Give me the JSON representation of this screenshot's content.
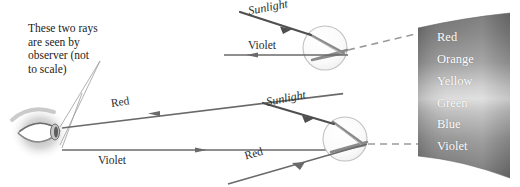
{
  "figure": {
    "background_color": "#ffffff",
    "ink_color": "#555555",
    "annotation": "These two rays\nare seen by\nobserver (not\nto scale)"
  },
  "labels": {
    "sunlight_top": "Sunlight",
    "violet_top": "Violet",
    "sunlight_bottom": "Sunlight",
    "red_bottom": "Red",
    "red_main": "Red",
    "violet_main": "Violet"
  },
  "spectrum": {
    "caption": "Visible spectrum band",
    "bands": [
      {
        "name": "Red",
        "y": 38
      },
      {
        "name": "Orange",
        "y": 60
      },
      {
        "name": "Yellow",
        "y": 82
      },
      {
        "name": "Green",
        "y": 104
      },
      {
        "name": "Blue",
        "y": 125
      },
      {
        "name": "Violet",
        "y": 147
      }
    ]
  },
  "observer": {
    "name": "eye"
  },
  "raindrops": [
    {
      "name": "upper-raindrop",
      "cx": 325,
      "cy": 48,
      "r": 22,
      "exit_ray": "Violet"
    },
    {
      "name": "lower-raindrop",
      "cx": 345,
      "cy": 139,
      "r": 22,
      "exit_ray": "Red"
    }
  ]
}
